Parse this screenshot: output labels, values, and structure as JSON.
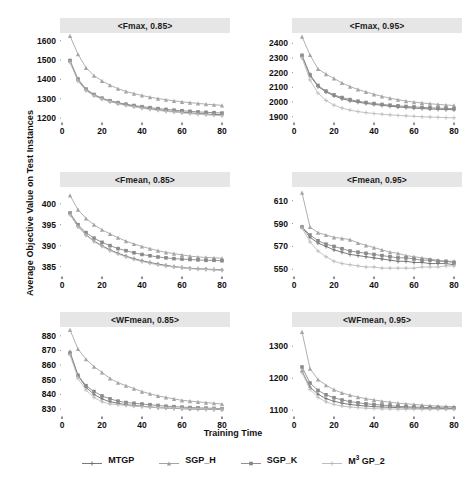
{
  "figure": {
    "ylabel": "Average Objective Value on Test Instances",
    "xlabel": "Training Time"
  },
  "legend": {
    "entries": [
      {
        "label": "MTGP",
        "color": "#6b6b6b",
        "marker": "plus"
      },
      {
        "label": "SGP_H",
        "color": "#9a9a9a",
        "marker": "triangle"
      },
      {
        "label": "SGP_K",
        "color": "#858585",
        "marker": "square"
      },
      {
        "label": "M3GP_2",
        "label_pre": "M",
        "label_sup": "3",
        "label_post": " GP_2",
        "color": "#b5b5b5",
        "marker": "cross"
      }
    ]
  },
  "chart_data": [
    {
      "type": "line",
      "title": "<Fmax, 0.85>",
      "xlabel": "Training Time",
      "ylabel": "Average Objective Value on Test Instances",
      "xlim": [
        0,
        84
      ],
      "ylim": [
        1185,
        1640
      ],
      "xticks": [
        0,
        20,
        40,
        60,
        80
      ],
      "yticks": [
        1200,
        1300,
        1400,
        1500,
        1600
      ],
      "grid": false,
      "x": [
        4,
        8,
        12,
        16,
        20,
        24,
        28,
        32,
        36,
        40,
        44,
        48,
        52,
        56,
        60,
        64,
        68,
        72,
        76,
        80
      ],
      "series": [
        {
          "name": "MTGP",
          "values": [
            1492,
            1395,
            1345,
            1318,
            1300,
            1287,
            1276,
            1268,
            1261,
            1254,
            1248,
            1243,
            1238,
            1234,
            1230,
            1227,
            1224,
            1221,
            1219,
            1217
          ]
        },
        {
          "name": "SGP_H",
          "values": [
            1625,
            1530,
            1460,
            1420,
            1392,
            1370,
            1352,
            1338,
            1327,
            1317,
            1308,
            1301,
            1295,
            1289,
            1284,
            1280,
            1276,
            1272,
            1269,
            1266
          ]
        },
        {
          "name": "SGP_K",
          "values": [
            1498,
            1402,
            1350,
            1322,
            1303,
            1290,
            1280,
            1272,
            1265,
            1259,
            1254,
            1249,
            1245,
            1241,
            1238,
            1235,
            1232,
            1230,
            1228,
            1226
          ]
        },
        {
          "name": "M3GP_2",
          "values": [
            1488,
            1392,
            1342,
            1316,
            1298,
            1285,
            1274,
            1265,
            1258,
            1251,
            1245,
            1240,
            1235,
            1231,
            1227,
            1223,
            1220,
            1217,
            1214,
            1212
          ]
        }
      ]
    },
    {
      "type": "line",
      "title": "<Fmax, 0.95>",
      "xlabel": "Training Time",
      "ylabel": "Average Objective Value on Test Instances",
      "xlim": [
        0,
        84
      ],
      "ylim": [
        1870,
        2470
      ],
      "xticks": [
        0,
        20,
        40,
        60,
        80
      ],
      "yticks": [
        1900,
        2000,
        2100,
        2200,
        2300,
        2400
      ],
      "grid": false,
      "x": [
        4,
        8,
        12,
        16,
        20,
        24,
        28,
        32,
        36,
        40,
        44,
        48,
        52,
        56,
        60,
        64,
        68,
        72,
        76,
        80
      ],
      "series": [
        {
          "name": "MTGP",
          "values": [
            2313,
            2180,
            2105,
            2068,
            2042,
            2022,
            2008,
            1998,
            1990,
            1983,
            1977,
            1971,
            1966,
            1962,
            1958,
            1955,
            1952,
            1950,
            1948,
            1947
          ]
        },
        {
          "name": "SGP_H",
          "values": [
            2445,
            2320,
            2225,
            2190,
            2160,
            2130,
            2105,
            2085,
            2068,
            2052,
            2038,
            2026,
            2015,
            2006,
            1999,
            1993,
            1988,
            1983,
            1979,
            1976
          ]
        },
        {
          "name": "SGP_K",
          "values": [
            2318,
            2186,
            2112,
            2074,
            2048,
            2030,
            2016,
            2005,
            1996,
            1989,
            1983,
            1978,
            1973,
            1969,
            1966,
            1963,
            1960,
            1958,
            1956,
            1954
          ]
        },
        {
          "name": "M3GP_2",
          "values": [
            2300,
            2150,
            2060,
            2010,
            1978,
            1958,
            1944,
            1934,
            1927,
            1921,
            1916,
            1912,
            1908,
            1905,
            1902,
            1899,
            1897,
            1895,
            1893,
            1892
          ]
        }
      ]
    },
    {
      "type": "line",
      "title": "<Fmean, 0.85>",
      "xlabel": "Training Time",
      "ylabel": "Average Objective Value on Test Instances",
      "xlim": [
        0,
        84
      ],
      "ylim": [
        383,
        404
      ],
      "xticks": [
        0,
        20,
        40,
        60,
        80
      ],
      "yticks": [
        385,
        390,
        395,
        400
      ],
      "grid": false,
      "x": [
        4,
        8,
        12,
        16,
        20,
        24,
        28,
        32,
        36,
        40,
        44,
        48,
        52,
        56,
        60,
        64,
        68,
        72,
        76,
        80
      ],
      "series": [
        {
          "name": "MTGP",
          "values": [
            397.5,
            394.6,
            392.6,
            391.1,
            390.0,
            389.0,
            388.2,
            387.5,
            386.9,
            386.4,
            386.0,
            385.6,
            385.3,
            385.0,
            384.8,
            384.6,
            384.5,
            384.4,
            384.3,
            384.2
          ]
        },
        {
          "name": "SGP_H",
          "values": [
            402.0,
            398.6,
            396.5,
            395.0,
            393.8,
            392.8,
            391.9,
            391.1,
            390.4,
            389.8,
            389.3,
            388.8,
            388.4,
            388.1,
            387.8,
            387.5,
            387.3,
            387.2,
            387.1,
            387.0
          ]
        },
        {
          "name": "SGP_K",
          "values": [
            397.8,
            395.0,
            393.1,
            391.8,
            390.8,
            390.0,
            389.3,
            388.8,
            388.3,
            387.9,
            387.6,
            387.3,
            387.1,
            386.9,
            386.8,
            386.7,
            386.6,
            386.5,
            386.5,
            386.4
          ]
        },
        {
          "name": "M3GP_2",
          "values": [
            397.4,
            394.5,
            392.5,
            391.0,
            389.8,
            388.8,
            388.0,
            387.3,
            386.7,
            386.2,
            385.8,
            385.4,
            385.1,
            384.9,
            384.7,
            384.5,
            384.4,
            384.3,
            384.2,
            384.1
          ]
        }
      ]
    },
    {
      "type": "line",
      "title": "<Fmean, 0.95>",
      "xlabel": "Training Time",
      "ylabel": "Average Objective Value on Test Instances",
      "xlim": [
        0,
        84
      ],
      "ylim": [
        545,
        622
      ],
      "xticks": [
        0,
        20,
        40,
        60,
        80
      ],
      "yticks": [
        550,
        570,
        590,
        610
      ],
      "grid": false,
      "x": [
        4,
        8,
        12,
        16,
        20,
        24,
        28,
        32,
        36,
        40,
        44,
        48,
        52,
        56,
        60,
        64,
        68,
        72,
        76,
        80
      ],
      "series": [
        {
          "name": "MTGP",
          "values": [
            587,
            578,
            573,
            570,
            567,
            565,
            563,
            562,
            561,
            560,
            559,
            558,
            557,
            557,
            556,
            556,
            555,
            555,
            555,
            554
          ]
        },
        {
          "name": "SGP_H",
          "values": [
            617,
            587,
            582,
            580,
            578,
            577,
            576,
            573,
            571,
            569,
            567,
            565,
            564,
            562,
            561,
            560,
            559,
            558,
            557,
            557
          ]
        },
        {
          "name": "SGP_K",
          "values": [
            587,
            580,
            575,
            572,
            570,
            568,
            566,
            565,
            564,
            563,
            562,
            561,
            560,
            560,
            559,
            558,
            558,
            557,
            557,
            556
          ]
        },
        {
          "name": "M3GP_2",
          "values": [
            586,
            574,
            566,
            561,
            557,
            555,
            554,
            553,
            552,
            552,
            551,
            551,
            551,
            551,
            551,
            552,
            552,
            552,
            553,
            553
          ]
        }
      ]
    },
    {
      "type": "line",
      "title": "<WFmean, 0.85>",
      "xlabel": "Training Time",
      "ylabel": "Average Objective Value on Test Instances",
      "xlim": [
        0,
        84
      ],
      "ylim": [
        826,
        886
      ],
      "xticks": [
        0,
        20,
        40,
        60,
        80
      ],
      "yticks": [
        830,
        840,
        850,
        860,
        870,
        880
      ],
      "grid": false,
      "x": [
        4,
        8,
        12,
        16,
        20,
        24,
        28,
        32,
        36,
        40,
        44,
        48,
        52,
        56,
        60,
        64,
        68,
        72,
        76,
        80
      ],
      "series": [
        {
          "name": "MTGP",
          "values": [
            869,
            853,
            845,
            840,
            837,
            835,
            834,
            833,
            832.5,
            832,
            831.5,
            831,
            830.8,
            830.5,
            830.3,
            830.1,
            830.0,
            829.9,
            829.8,
            829.7
          ]
        },
        {
          "name": "SGP_H",
          "values": [
            884,
            871,
            864,
            859,
            855,
            851,
            848,
            846,
            844,
            842,
            840.5,
            839,
            838,
            837,
            836,
            835.5,
            835,
            834.5,
            834,
            833.5
          ]
        },
        {
          "name": "SGP_K",
          "values": [
            868,
            853,
            846,
            842,
            839,
            837,
            835.5,
            834.5,
            834,
            833.5,
            833,
            832.5,
            832,
            831.7,
            831.4,
            831.1,
            830.9,
            830.7,
            830.5,
            830.3
          ]
        },
        {
          "name": "M3GP_2",
          "values": [
            867,
            851,
            843,
            838,
            835,
            833.5,
            833,
            832.5,
            832,
            831.7,
            831.4,
            831.1,
            830.9,
            830.7,
            830.5,
            830.3,
            830.2,
            830.1,
            830.0,
            829.9
          ]
        }
      ]
    },
    {
      "type": "line",
      "title": "<WFmean, 0.95>",
      "xlabel": "Training Time",
      "ylabel": "Average Objective Value on Test Instances",
      "xlim": [
        0,
        84
      ],
      "ylim": [
        1085,
        1360
      ],
      "xticks": [
        0,
        20,
        40,
        60,
        80
      ],
      "yticks": [
        1100,
        1200,
        1300
      ],
      "grid": false,
      "x": [
        4,
        8,
        12,
        16,
        20,
        24,
        28,
        32,
        36,
        40,
        44,
        48,
        52,
        56,
        60,
        64,
        68,
        72,
        76,
        80
      ],
      "series": [
        {
          "name": "MTGP",
          "values": [
            1222,
            1172,
            1150,
            1136,
            1128,
            1122,
            1118,
            1115,
            1113,
            1111,
            1110,
            1109,
            1108,
            1107,
            1107,
            1106,
            1106,
            1106,
            1105,
            1105
          ]
        },
        {
          "name": "SGP_H",
          "values": [
            1345,
            1230,
            1196,
            1178,
            1164,
            1154,
            1147,
            1141,
            1136,
            1132,
            1128,
            1125,
            1122,
            1120,
            1118,
            1116,
            1114,
            1113,
            1112,
            1111
          ]
        },
        {
          "name": "SGP_K",
          "values": [
            1235,
            1185,
            1162,
            1148,
            1139,
            1132,
            1127,
            1123,
            1120,
            1118,
            1116,
            1114,
            1112,
            1111,
            1110,
            1109,
            1108,
            1108,
            1107,
            1107
          ]
        },
        {
          "name": "M3GP_2",
          "values": [
            1218,
            1165,
            1140,
            1126,
            1118,
            1113,
            1110,
            1108,
            1106,
            1105,
            1104,
            1104,
            1103,
            1103,
            1103,
            1103,
            1103,
            1103,
            1103,
            1103
          ]
        }
      ]
    }
  ]
}
